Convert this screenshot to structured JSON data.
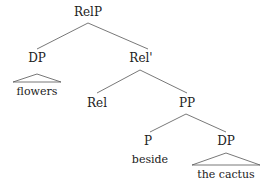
{
  "tree": {
    "root": {
      "label": "RelP"
    },
    "nodes": {
      "dp1": {
        "label": "DP"
      },
      "dp1_leaf": {
        "label": "flowers"
      },
      "relbar": {
        "label": "Rel'"
      },
      "rel": {
        "label": "Rel"
      },
      "pp": {
        "label": "PP"
      },
      "p": {
        "label": "P"
      },
      "p_leaf": {
        "label": "beside"
      },
      "dp2": {
        "label": "DP"
      },
      "dp2_leaf": {
        "label": "the cactus"
      }
    }
  }
}
